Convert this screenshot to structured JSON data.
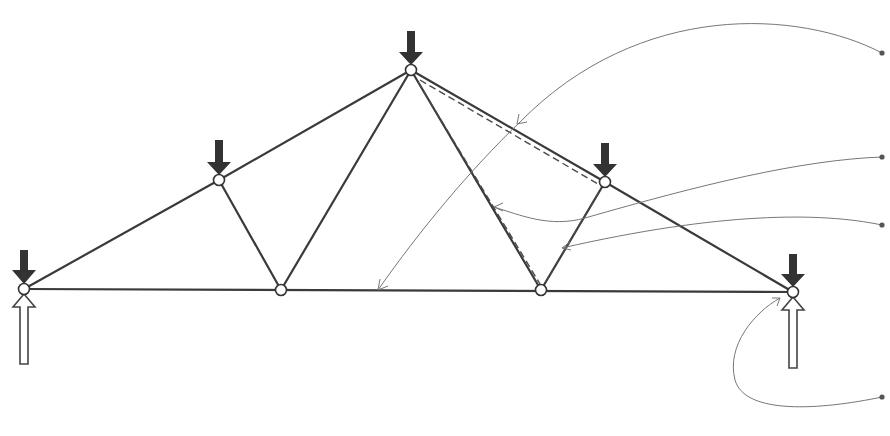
{
  "diagram": {
    "type": "roof-truss-free-body",
    "colors": {
      "member": "#3a3a3a",
      "load_arrow": "#333333",
      "support_arrow_outline": "#444444",
      "leader_line": "#777777",
      "label_dot": "#555555",
      "background": "#ffffff"
    },
    "nodes": [
      {
        "id": "A",
        "x": 24,
        "y": 289
      },
      {
        "id": "B",
        "x": 219,
        "y": 180
      },
      {
        "id": "C",
        "x": 281,
        "y": 290
      },
      {
        "id": "D",
        "x": 411,
        "y": 70
      },
      {
        "id": "E",
        "x": 541,
        "y": 290
      },
      {
        "id": "F",
        "x": 605,
        "y": 182
      },
      {
        "id": "G",
        "x": 793,
        "y": 292
      }
    ],
    "members": [
      [
        "A",
        "B"
      ],
      [
        "B",
        "D"
      ],
      [
        "D",
        "F"
      ],
      [
        "F",
        "G"
      ],
      [
        "A",
        "C"
      ],
      [
        "C",
        "E"
      ],
      [
        "E",
        "G"
      ],
      [
        "B",
        "C"
      ],
      [
        "C",
        "D"
      ],
      [
        "D",
        "E"
      ],
      [
        "E",
        "F"
      ]
    ],
    "highlighted_section": {
      "style": "dashed",
      "members": [
        [
          "D",
          "F"
        ],
        [
          "D",
          "E"
        ],
        [
          "E",
          "F"
        ]
      ]
    },
    "point_loads": [
      {
        "node": "A",
        "direction": "down"
      },
      {
        "node": "B",
        "direction": "down"
      },
      {
        "node": "D",
        "direction": "down"
      },
      {
        "node": "F",
        "direction": "down"
      },
      {
        "node": "G",
        "direction": "down"
      }
    ],
    "reactions": [
      {
        "node": "A",
        "direction": "up"
      },
      {
        "node": "G",
        "direction": "up"
      }
    ],
    "callouts": [
      {
        "id": "callout-1",
        "dot": {
          "x": 882,
          "y": 53
        },
        "target": "bottom-chord",
        "label": ""
      },
      {
        "id": "callout-2",
        "dot": {
          "x": 882,
          "y": 157
        },
        "target": "diagonal-member-DE",
        "label": ""
      },
      {
        "id": "callout-3",
        "dot": {
          "x": 882,
          "y": 225
        },
        "target": "diagonal-member-EF",
        "label": ""
      },
      {
        "id": "callout-4",
        "dot": {
          "x": 882,
          "y": 397
        },
        "target": "support-node-G",
        "label": ""
      }
    ]
  }
}
